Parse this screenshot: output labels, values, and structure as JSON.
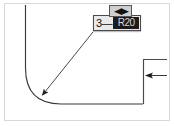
{
  "figure": {
    "title": "Fillet radius inline dimension edit",
    "background_color": "#ffffff",
    "frame_color": "#d8d8d8",
    "geometry_color": "#2a2a2a"
  },
  "dimension_editor": {
    "prefix_label": "3—",
    "value": "R20",
    "value_state": "selected",
    "value_text_color": "#d7d7d7",
    "value_background_color": "#1b1b1b",
    "field_background_color": "#e9e9e9",
    "border_color": "#4a4a4a"
  },
  "drag_handle": {
    "icon": "left-right-arrow-icon",
    "glyph": "◀▶",
    "background_color": "#cfcfcf",
    "border_color": "#555555"
  },
  "leader": {
    "arrow_label": "radius-leader-arrow",
    "start": "93,31",
    "end": "41,96"
  },
  "dimension_arrow": {
    "arrow_label": "width-dimension-arrow",
    "direction": "left"
  },
  "geometry": {
    "profile_label": "filleted-corner-profile",
    "right_wall_label": "right-wall-profile"
  }
}
